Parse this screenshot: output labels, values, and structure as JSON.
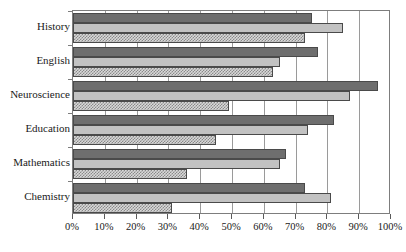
{
  "chart_data": {
    "type": "bar",
    "orientation": "horizontal",
    "title": "",
    "subtitle": "",
    "xlabel": "",
    "ylabel": "",
    "xlim": [
      0,
      100
    ],
    "xticks": [
      0,
      10,
      20,
      30,
      40,
      50,
      60,
      70,
      80,
      90,
      100
    ],
    "xticklabels": [
      "0%",
      "10%",
      "20%",
      "30%",
      "40%",
      "50%",
      "60%",
      "70%",
      "80%",
      "90%",
      "100%"
    ],
    "grid": true,
    "grid_axis": "x",
    "legend": false,
    "legend_position": "none",
    "categories": [
      "History",
      "English",
      "Neuroscience",
      "Education",
      "Mathematics",
      "Chemistry"
    ],
    "series": [
      {
        "name": "series-1",
        "style": "dark-solid",
        "color": "#6e6e6e",
        "values": [
          75,
          77,
          96,
          82,
          67,
          73
        ]
      },
      {
        "name": "series-2",
        "style": "light-solid",
        "color": "#c2c2c2",
        "values": [
          85,
          65,
          87,
          74,
          65,
          81
        ]
      },
      {
        "name": "series-3",
        "style": "checkered-hatch",
        "color": "#8a8a8a",
        "values": [
          73,
          63,
          49,
          45,
          36,
          31
        ]
      }
    ]
  },
  "colors": {
    "series_dark": "#6e6e6e",
    "series_light": "#c2c2c2",
    "series_hatch": "#8a8a8a",
    "bar_edge": "#4a4a4a",
    "axis": "#7d7d7d",
    "gridline": "#9a9a9a",
    "text": "#1a1a1a",
    "background": "#ffffff"
  }
}
